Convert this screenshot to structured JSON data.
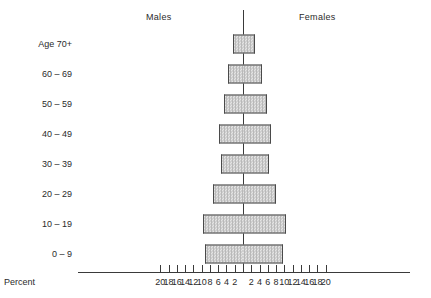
{
  "header": {
    "males_label": "Males",
    "females_label": "Females"
  },
  "axis": {
    "percent_label": "Percent",
    "left_ticks": [
      20,
      18,
      16,
      14,
      12,
      10,
      8,
      6,
      4,
      2
    ],
    "right_ticks": [
      2,
      4,
      6,
      8,
      10,
      12,
      14,
      16,
      18,
      20
    ]
  },
  "caption": {
    "partial_text": ""
  },
  "chart_data": {
    "type": "bar",
    "title": "",
    "subtitle": "",
    "orientation": "horizontal-diverging",
    "chart_kind": "population-pyramid",
    "categories": [
      "Age 70+",
      "60 – 69",
      "50 – 59",
      "40 – 49",
      "30 – 39",
      "20 – 29",
      "10 – 19",
      "0 – 9"
    ],
    "series": [
      {
        "name": "Males",
        "side": "left",
        "values": [
          2.5,
          3.6,
          4.6,
          5.7,
          5.2,
          7.3,
          9.7,
          9.1
        ]
      },
      {
        "name": "Females",
        "side": "right",
        "values": [
          3.0,
          4.6,
          5.7,
          6.8,
          6.2,
          7.9,
          10.3,
          9.6
        ]
      }
    ],
    "xlabel": "Percent",
    "ylabel": "",
    "xlim": [
      -20,
      20
    ],
    "xtick_step": 2,
    "grid": false,
    "legend": "top-inline",
    "colors": {
      "bar_fill": "#cccccc",
      "bar_border": "#4a4a4a",
      "axis": "#3a3a3a",
      "text": "#2b2b2b",
      "background": "#ffffff"
    }
  }
}
